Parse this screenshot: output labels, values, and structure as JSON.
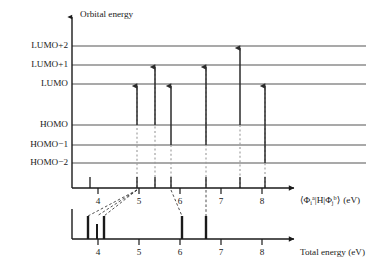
{
  "figure": {
    "title_top_axis": "Orbital energy",
    "colors": {
      "ink": "#1a1a1a",
      "level_line": "#555555",
      "arrow": "#2b2b2b",
      "dotted_guide": "#9a9a9a",
      "dashed_connector": "#3a3a3a",
      "background": "#ffffff"
    }
  },
  "orbital_panel": {
    "axis_label": "Orbital energy",
    "levels": [
      {
        "label": "LUMO+2",
        "y": 46
      },
      {
        "label": "LUMO+1",
        "y": 65
      },
      {
        "label": "LUMO",
        "y": 84
      },
      {
        "label": "HOMO",
        "y": 125
      },
      {
        "label": "HOMO−1",
        "y": 145
      },
      {
        "label": "HOMO−2",
        "y": 163
      }
    ],
    "transitions": [
      {
        "x": 137,
        "from": "HOMO",
        "to": "LUMO",
        "from_y": 125,
        "to_y": 84
      },
      {
        "x": 155,
        "from": "HOMO",
        "to": "LUMO+1",
        "from_y": 125,
        "to_y": 65
      },
      {
        "x": 171,
        "from": "HOMO−1",
        "to": "LUMO",
        "from_y": 145,
        "to_y": 84
      },
      {
        "x": 206,
        "from": "HOMO−1",
        "to": "LUMO+1",
        "from_y": 145,
        "to_y": 65
      },
      {
        "x": 240,
        "from": "HOMO",
        "to": "LUMO+2",
        "from_y": 125,
        "to_y": 46
      },
      {
        "x": 265,
        "from": "HOMO−2",
        "to": "LUMO",
        "from_y": 163,
        "to_y": 84
      }
    ]
  },
  "middle_axis": {
    "label_parts": {
      "open_bracket": "⟨",
      "phi1": "Φ",
      "phi1_sub": "i",
      "phi1_sup": "a",
      "bar": "|",
      "hamiltonian": "H",
      "phi2": "Φ",
      "phi2_sub": "j",
      "phi2_sup": "b",
      "close_bracket": "⟩",
      "units": "(eV)"
    },
    "label_plain": "⟨Φiᵃ|H|Φjᵇ⟩ (eV)",
    "ticks": [
      {
        "value": "4",
        "x": 98
      },
      {
        "value": "5",
        "x": 139
      },
      {
        "value": "6",
        "x": 180
      },
      {
        "value": "7",
        "x": 221
      },
      {
        "value": "8",
        "x": 262
      }
    ],
    "sticks": [
      {
        "x": 90,
        "height": 11
      },
      {
        "x": 137,
        "height": 11
      },
      {
        "x": 155,
        "height": 11
      },
      {
        "x": 171,
        "height": 11
      },
      {
        "x": 206,
        "height": 11
      },
      {
        "x": 240,
        "height": 11
      },
      {
        "x": 265,
        "height": 11
      }
    ]
  },
  "bottom_axis": {
    "label": "Total energy (eV)",
    "ticks": [
      {
        "value": "4",
        "x": 98
      },
      {
        "value": "5",
        "x": 139
      },
      {
        "value": "6",
        "x": 180
      },
      {
        "value": "7",
        "x": 221
      },
      {
        "value": "8",
        "x": 262
      }
    ],
    "sticks": [
      {
        "x": 88,
        "height": 23
      },
      {
        "x": 97,
        "height": 15
      },
      {
        "x": 104,
        "height": 23
      },
      {
        "x": 182,
        "height": 23
      },
      {
        "x": 206,
        "height": 23
      }
    ]
  },
  "connectors": [
    {
      "from_x": 137,
      "to_x": 88
    },
    {
      "from_x": 137,
      "to_x": 97
    },
    {
      "from_x": 137,
      "to_x": 104
    },
    {
      "from_x": 171,
      "to_x": 182
    },
    {
      "from_x": 206,
      "to_x": 206
    }
  ],
  "dotted_guides": [
    {
      "x": 137,
      "top": 84,
      "bottom": 188
    },
    {
      "x": 155,
      "top": 65,
      "bottom": 188
    },
    {
      "x": 171,
      "top": 145,
      "bottom": 188
    },
    {
      "x": 206,
      "top": 65,
      "bottom": 188
    },
    {
      "x": 240,
      "top": 125,
      "bottom": 188
    },
    {
      "x": 265,
      "top": 84,
      "bottom": 188
    }
  ]
}
